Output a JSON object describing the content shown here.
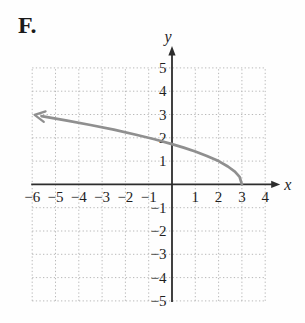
{
  "figure": {
    "label": "F."
  },
  "chart_data": {
    "type": "line",
    "title": "",
    "xlabel": "x",
    "ylabel": "y",
    "xlim": [
      -6,
      4
    ],
    "ylim": [
      -5,
      5
    ],
    "x_ticks": [
      -6,
      -5,
      -4,
      -3,
      -2,
      -1,
      1,
      2,
      3,
      4
    ],
    "y_ticks": [
      -5,
      -4,
      -3,
      -2,
      -1,
      1,
      2,
      3,
      4,
      5
    ],
    "grid": "dotted",
    "legend": "none",
    "series": [
      {
        "name": "sqrt-curve",
        "function": "y = sqrt(3 - x)",
        "endpoint": [
          3,
          0
        ],
        "arrow_end": "left",
        "color": "#8f8f8f",
        "points": [
          [
            3,
            0
          ],
          [
            2.9,
            0.32
          ],
          [
            2.7,
            0.55
          ],
          [
            2.4,
            0.77
          ],
          [
            2,
            1
          ],
          [
            1.5,
            1.22
          ],
          [
            1,
            1.41
          ],
          [
            0.5,
            1.58
          ],
          [
            0,
            1.73
          ],
          [
            -0.75,
            1.94
          ],
          [
            -1.5,
            2.12
          ],
          [
            -2.5,
            2.35
          ],
          [
            -3.5,
            2.55
          ],
          [
            -4.5,
            2.74
          ],
          [
            -5.6,
            2.93
          ]
        ]
      }
    ],
    "colors": {
      "axis": "#2d2d2d",
      "grid": "#b8b8b8",
      "tick_label": "#1f1f1f",
      "curve": "#8f8f8f"
    }
  }
}
